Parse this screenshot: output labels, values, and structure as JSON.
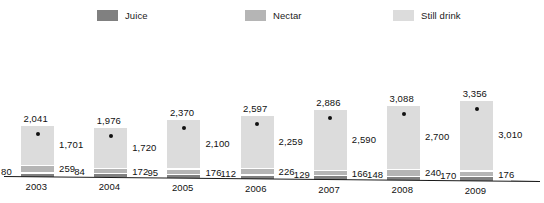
{
  "legend": {
    "items": [
      {
        "label": "Juice",
        "color": "#808080",
        "swatch_name": "legend-swatch-juice"
      },
      {
        "label": "Nectar",
        "color": "#b5b5b5",
        "swatch_name": "legend-swatch-nectar"
      },
      {
        "label": "Still drink",
        "color": "#dcdcdc",
        "swatch_name": "legend-swatch-still-drink"
      }
    ]
  },
  "chart_data": {
    "type": "bar",
    "title": "",
    "subtitle": "",
    "xlabel": "",
    "ylabel": "",
    "stacked": true,
    "grid": false,
    "legend_position": "top",
    "ylim": [
      0,
      3356
    ],
    "categories": [
      "2003",
      "2004",
      "2005",
      "2006",
      "2007",
      "2008",
      "2009"
    ],
    "series": [
      {
        "name": "Juice",
        "color": "#808080",
        "values": [
          80,
          84,
          95,
          112,
          129,
          148,
          170
        ]
      },
      {
        "name": "Nectar",
        "color": "#b5b5b5",
        "values": [
          259,
          172,
          176,
          226,
          166,
          240,
          176
        ]
      },
      {
        "name": "Still drink",
        "color": "#dcdcdc",
        "values": [
          1701,
          1720,
          2100,
          2259,
          2590,
          2700,
          3010
        ]
      }
    ],
    "totals": [
      2041,
      1976,
      2370,
      2597,
      2886,
      3088,
      3356
    ],
    "total_labels": [
      "2,041",
      "1,976",
      "2,370",
      "2,597",
      "2,886",
      "3,088",
      "3,356"
    ],
    "juice_labels": [
      "80",
      "84",
      "95",
      "112",
      "129",
      "148",
      "170"
    ],
    "nectar_labels": [
      "259",
      "172",
      "176",
      "226",
      "166",
      "240",
      "176"
    ],
    "still_labels": [
      "1,701",
      "1,720",
      "2,100",
      "2,259",
      "2,590",
      "2,700",
      "3,010"
    ],
    "marker": {
      "shape": "dot",
      "color": "#111111"
    }
  }
}
